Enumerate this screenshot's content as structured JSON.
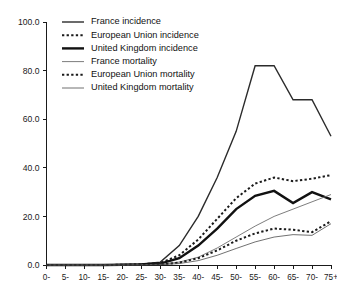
{
  "chart_data": {
    "type": "line",
    "title": "",
    "subtitle": "",
    "xlabel": "",
    "ylabel": "",
    "xlim": [
      0,
      15
    ],
    "ylim": [
      0.0,
      100.0
    ],
    "grid": false,
    "legend_position": "top-left",
    "y_ticks": [
      "0.0",
      "20.0",
      "40.0",
      "60.0",
      "80.0",
      "100.0"
    ],
    "y_tick_values": [
      0,
      20,
      40,
      60,
      80,
      100
    ],
    "categories": [
      "0-",
      "5-",
      "10-",
      "15-",
      "20-",
      "25-",
      "30-",
      "35-",
      "40-",
      "45-",
      "50-",
      "55-",
      "60-",
      "65-",
      "70-",
      "75+"
    ],
    "series": [
      {
        "name": "France incidence",
        "style": "solid",
        "width": 1.4,
        "color": "#2b2b2b",
        "values": [
          0.0,
          0.0,
          0.0,
          0.0,
          0.2,
          0.4,
          1.2,
          8.0,
          20.0,
          36.0,
          55.0,
          82.0,
          82.0,
          68.0,
          68.0,
          53.0
        ]
      },
      {
        "name": "European Union incidence",
        "style": "dotted",
        "width": 2.0,
        "color": "#1a1a1a",
        "values": [
          0.0,
          0.0,
          0.0,
          0.0,
          0.1,
          0.3,
          0.8,
          4.0,
          10.5,
          19.0,
          27.5,
          33.5,
          36.0,
          34.5,
          35.5,
          37.0
        ]
      },
      {
        "name": "United Kingdom incidence",
        "style": "solid",
        "width": 2.4,
        "color": "#111111",
        "values": [
          0.0,
          0.0,
          0.0,
          0.0,
          0.1,
          0.2,
          0.6,
          2.8,
          8.0,
          15.0,
          23.0,
          28.5,
          30.5,
          25.5,
          30.0,
          27.0
        ]
      },
      {
        "name": "France mortality",
        "style": "solid",
        "width": 0.9,
        "color": "#6e6e6e",
        "values": [
          0.0,
          0.0,
          0.0,
          0.0,
          0.0,
          0.1,
          0.3,
          1.2,
          3.2,
          7.0,
          11.5,
          16.0,
          20.0,
          23.0,
          26.0,
          29.0
        ]
      },
      {
        "name": "European Union mortality",
        "style": "dotted",
        "width": 2.0,
        "color": "#1a1a1a",
        "values": [
          0.0,
          0.0,
          0.0,
          0.0,
          0.0,
          0.1,
          0.2,
          1.0,
          2.8,
          6.0,
          10.0,
          13.0,
          15.0,
          14.5,
          13.5,
          18.0
        ]
      },
      {
        "name": "United Kingdom mortality",
        "style": "solid",
        "width": 0.8,
        "color": "#4d4d4d",
        "values": [
          0.0,
          0.0,
          0.0,
          0.0,
          0.0,
          0.0,
          0.1,
          0.6,
          1.8,
          4.0,
          6.8,
          9.5,
          11.5,
          12.5,
          12.2,
          17.0
        ]
      }
    ]
  }
}
